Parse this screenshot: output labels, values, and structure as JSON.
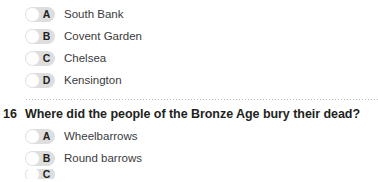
{
  "previous_question": {
    "options": [
      {
        "letter": "A",
        "label": "South Bank",
        "selected": false
      },
      {
        "letter": "B",
        "label": "Covent Garden",
        "selected": false
      },
      {
        "letter": "C",
        "label": "Chelsea",
        "selected": false
      },
      {
        "letter": "D",
        "label": "Kensington",
        "selected": false
      }
    ]
  },
  "current_question": {
    "number": "16",
    "text": "Where did the people of the Bronze Age bury their dead?",
    "options": [
      {
        "letter": "A",
        "label": "Wheelbarrows",
        "selected": false
      },
      {
        "letter": "B",
        "label": "Round barrows",
        "selected": false
      },
      {
        "letter": "C",
        "label": "",
        "selected": false
      }
    ]
  },
  "colors": {
    "page_background": "#ffffff",
    "control_track": "#dededf",
    "control_knob": "#ffffff",
    "letter_text": "#231f20",
    "option_text": "#3b3b3d",
    "question_text": "#231f20",
    "divider_dots": "#b9b9bb"
  }
}
